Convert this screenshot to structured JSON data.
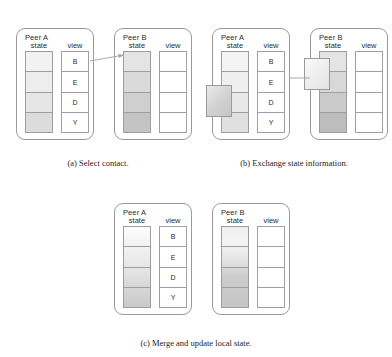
{
  "figure": {
    "panels": [
      {
        "id": "a",
        "caption": "(a) Select contact.",
        "peers": [
          {
            "title": "Peer A",
            "state_header": "state",
            "view_header": "view",
            "state_cells": [
              "#f2f2f2",
              "#ededed",
              "#e6e6e6",
              "#dcdcdc"
            ],
            "view_cells": [
              "B",
              "E",
              "D",
              "Y"
            ]
          },
          {
            "title": "Peer B",
            "state_header": "state",
            "view_header": "view",
            "state_cells": [
              "#e4e4e4",
              "#dadada",
              "#cfcfcf",
              "#c4c4c4"
            ],
            "view_cells": [
              "",
              "",
              "",
              ""
            ]
          }
        ],
        "connector": "arrow-from-view-b-to-peer-b-state"
      },
      {
        "id": "b",
        "caption": "(b) Exchange state information.",
        "peers": [
          {
            "title": "Peer A",
            "state_header": "state",
            "view_header": "view",
            "state_cells": [
              "#f4f4f4",
              "#efefef",
              "#e8e8e8",
              "#e0e0e0"
            ],
            "view_cells": [
              "B",
              "E",
              "D",
              "Y"
            ],
            "float_block": "#d2d2d2"
          },
          {
            "title": "Peer B",
            "state_header": "state",
            "view_header": "view",
            "state_cells": [
              "#e4e4e4",
              "#d8d8d8",
              "#cbcbcb",
              "#bdbdbd"
            ],
            "view_cells": [
              "",
              "",
              "",
              ""
            ],
            "float_block": "#efefef"
          }
        ],
        "connector": "line-between-peers"
      },
      {
        "id": "c",
        "caption": "(c) Merge and update local state.",
        "peers": [
          {
            "title": "Peer A",
            "state_header": "state",
            "view_header": "view",
            "state_cells": [
              "#fbfbfb",
              "#eeeeee",
              "#e0e0e0",
              "#d4d4d4"
            ],
            "view_cells": [
              "B",
              "E",
              "D",
              "Y"
            ]
          },
          {
            "title": "Peer B",
            "state_header": "state",
            "view_header": "view",
            "state_cells": [
              "#ebebeb",
              "#dfdfdf",
              "#cccccc",
              "#c2c2c2"
            ],
            "view_cells": [
              "",
              "",
              "",
              ""
            ]
          }
        ]
      }
    ]
  },
  "colors": {
    "outline": "#9a9a9a",
    "text": "#2b2b2b",
    "caption_text": "#1c1c1c",
    "connector": "#a8a8a8",
    "background": "#ffffff"
  }
}
